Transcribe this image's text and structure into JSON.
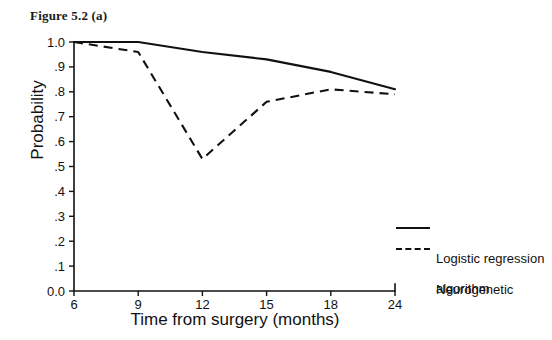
{
  "figure": {
    "caption": "Figure 5.2 (a)"
  },
  "chart_data": {
    "type": "line",
    "title": "Figure 5.2 (a)",
    "xlabel": "Time from surgery (months)",
    "ylabel": "Probability",
    "x": [
      6,
      9,
      12,
      15,
      18,
      24
    ],
    "xtick_labels": [
      "6",
      "9",
      "12",
      "15",
      "18",
      "24"
    ],
    "ytick_labels": [
      "0.0",
      ".1",
      ".2",
      ".3",
      ".4",
      ".5",
      ".6",
      ".7",
      ".8",
      ".9",
      "1.0"
    ],
    "ytick_values": [
      0.0,
      0.1,
      0.2,
      0.3,
      0.4,
      0.5,
      0.6,
      0.7,
      0.8,
      0.9,
      1.0
    ],
    "ylim": [
      0.0,
      1.0
    ],
    "grid": false,
    "legend_position": "right",
    "series": [
      {
        "name": "Logistic regression",
        "style": "solid",
        "color": "#111111",
        "values": [
          1.0,
          1.0,
          0.96,
          0.93,
          0.88,
          0.81
        ]
      },
      {
        "name": "Neurogenetic algorithm",
        "style": "dashed",
        "color": "#111111",
        "values": [
          1.0,
          0.96,
          0.53,
          0.76,
          0.81,
          0.79
        ]
      }
    ]
  },
  "legend": {
    "items": [
      {
        "label": "Logistic regression",
        "style": "solid"
      },
      {
        "label": "Neurogenetic",
        "label2": "algorithm",
        "style": "dashed"
      }
    ]
  }
}
